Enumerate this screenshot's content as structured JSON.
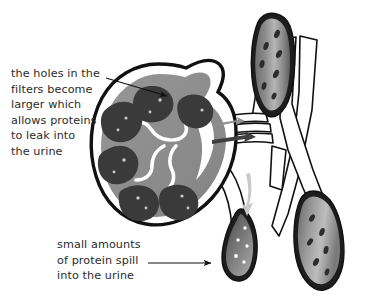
{
  "figure": {
    "background_color": "#ffffff",
    "text_color": "#2b2b2b"
  },
  "annotations": [
    {
      "id": "filters",
      "text": "the holes in the\nfilters become\nlarger which\nallows proteins\nto leak into\nthe urine",
      "pointer": "arrow pointing down-right into kidney cortex"
    },
    {
      "id": "protein",
      "text": "small amounts\nof protein spill\ninto the urine",
      "pointer": "arrow pointing right to lower ureter segment"
    }
  ],
  "colors": {
    "outline": "#111111",
    "cortex_gray": "#8d8d8d",
    "pyramid_dark": "#3a3a3a",
    "calyx_white": "#ffffff",
    "vessel_mid_gray": "#9a9a9a",
    "vessel_light_gray": "#b9b9b9",
    "vessel_dark_gray": "#4a4a4a",
    "arrow_gray": "#c9c9c9",
    "arrow_dark": "#3f3f3f",
    "spill_dot": "#ffffff"
  },
  "structures": {
    "kidney": "kidney longitudinal cross-section, left of center",
    "upper_vessel": "upper right ureter/vessel cross-section with dark speckles",
    "lower_right_vessel": "lower right ureter/vessel cross-section with dark speckles",
    "lower_center_vessel": "lower center ureter segment with white protein dots",
    "tubes": "white outlined renal vessels crossing diagonally",
    "flow_arrows": "dark arrows at renal hilum and light gray arrow down the ureter"
  }
}
